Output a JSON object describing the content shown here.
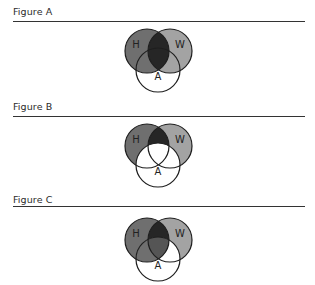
{
  "figures": [
    {
      "id": "A",
      "title": "Figure A",
      "labels": {
        "h": "H",
        "w": "W",
        "a": "A"
      },
      "shading": "H and W shaded entirely; H∩W fully dark (including overlap with A); A-only region white"
    },
    {
      "id": "B",
      "title": "Figure B",
      "labels": {
        "h": "H",
        "w": "W",
        "a": "A"
      },
      "shading": "H and W shaded outside A; H∩W outside A dark; entire A region white"
    },
    {
      "id": "C",
      "title": "Figure C",
      "labels": {
        "h": "H",
        "w": "W",
        "a": "A"
      },
      "shading": "H and W shaded; H∩W outside A dark; H∩A shaded; H∩W∩A medium; W∩A only white; A-only white"
    }
  ],
  "colors": {
    "h_fill": "#6f6f6f",
    "w_fill": "#a3a3a3",
    "dark_fill": "#262626",
    "triple_fill": "#555555",
    "stroke": "#1e1e1e",
    "background": "#ffffff"
  }
}
